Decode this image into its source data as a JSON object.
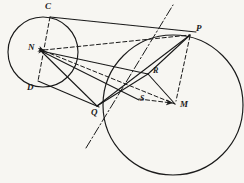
{
  "figure": {
    "background_color": "#f7f6f2",
    "ink_color": "#1a1a1a",
    "style": "hand-drawn pencil sketch",
    "labels": [
      {
        "text": "C",
        "x": 45,
        "y": 3,
        "name": "point-label-c"
      },
      {
        "text": "N",
        "x": 29,
        "y": 44,
        "name": "point-label-n"
      },
      {
        "text": "D",
        "x": 28,
        "y": 84,
        "name": "point-label-d"
      },
      {
        "text": "Q",
        "x": 91,
        "y": 108,
        "name": "point-label-q"
      },
      {
        "text": "P",
        "x": 196,
        "y": 25,
        "name": "point-label-p"
      },
      {
        "text": "R",
        "x": 154,
        "y": 68,
        "name": "point-label-r"
      },
      {
        "text": "S",
        "x": 141,
        "y": 96,
        "name": "point-label-s"
      },
      {
        "text": "M",
        "x": 180,
        "y": 101,
        "name": "point-label-m"
      }
    ],
    "circles": [
      {
        "name": "small-circle-left",
        "cx": 43,
        "cy": 52,
        "r": 35
      },
      {
        "name": "large-circle-right",
        "cx": 173,
        "cy": 105,
        "r": 70
      }
    ],
    "points": [
      {
        "name": "point-c",
        "x": 50,
        "y": 17
      },
      {
        "name": "point-n",
        "x": 40,
        "y": 50
      },
      {
        "name": "point-d",
        "x": 38,
        "y": 81
      },
      {
        "name": "point-q",
        "x": 97,
        "y": 106
      },
      {
        "name": "point-p",
        "x": 190,
        "y": 35
      },
      {
        "name": "point-r",
        "x": 148,
        "y": 74
      },
      {
        "name": "point-s",
        "x": 137,
        "y": 99
      },
      {
        "name": "point-m",
        "x": 175,
        "y": 104
      }
    ],
    "solid_segments": [
      {
        "name": "tangent-line-top",
        "x1": 50,
        "y1": 17,
        "x2": 193,
        "y2": 33
      },
      {
        "name": "tangent-line-bottom",
        "x1": 38,
        "y1": 81,
        "x2": 97,
        "y2": 106
      },
      {
        "name": "segment-q-p",
        "x1": 97,
        "y1": 106,
        "x2": 190,
        "y2": 35
      },
      {
        "name": "segment-n-q",
        "x1": 40,
        "y1": 50,
        "x2": 97,
        "y2": 106
      },
      {
        "name": "segment-n-r",
        "x1": 40,
        "y1": 50,
        "x2": 148,
        "y2": 74
      },
      {
        "name": "segment-p-r",
        "x1": 190,
        "y1": 35,
        "x2": 148,
        "y2": 74
      },
      {
        "name": "segment-p-m",
        "x1": 190,
        "y1": 35,
        "x2": 175,
        "y2": 104
      },
      {
        "name": "segment-r-m",
        "x1": 148,
        "y1": 74,
        "x2": 175,
        "y2": 104
      },
      {
        "name": "segment-q-r",
        "x1": 97,
        "y1": 106,
        "x2": 148,
        "y2": 74
      },
      {
        "name": "segment-n-s",
        "x1": 40,
        "y1": 50,
        "x2": 137,
        "y2": 99
      }
    ],
    "dashed_segments": [
      {
        "name": "chord-c-d",
        "x1": 50,
        "y1": 17,
        "x2": 38,
        "y2": 81
      },
      {
        "name": "segment-n-p",
        "x1": 40,
        "y1": 50,
        "x2": 190,
        "y2": 35
      },
      {
        "name": "segment-n-m",
        "x1": 40,
        "y1": 50,
        "x2": 175,
        "y2": 104
      },
      {
        "name": "segment-s-m",
        "x1": 137,
        "y1": 99,
        "x2": 175,
        "y2": 104
      },
      {
        "name": "segment-p-m-dashed",
        "x1": 190,
        "y1": 35,
        "x2": 176,
        "y2": 100
      }
    ],
    "axis_line": {
      "name": "dash-dot-axis",
      "x1": 86,
      "y1": 148,
      "x2": 173,
      "y2": 5,
      "style": "dash-dot"
    },
    "arrowheads": [
      {
        "name": "arrowhead-at-n",
        "x": 40,
        "y": 50
      },
      {
        "name": "arrowhead-at-m",
        "x": 175,
        "y": 104
      }
    ]
  }
}
